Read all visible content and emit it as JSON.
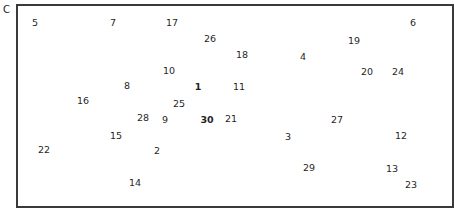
{
  "corner_label": "C",
  "frame": {
    "border_color": "#3a3a3a"
  },
  "numbers": [
    {
      "label": "5",
      "x": 35,
      "y": 23,
      "bold": false
    },
    {
      "label": "7",
      "x": 113,
      "y": 23,
      "bold": false
    },
    {
      "label": "17",
      "x": 172,
      "y": 23,
      "bold": false
    },
    {
      "label": "6",
      "x": 413,
      "y": 23,
      "bold": false
    },
    {
      "label": "26",
      "x": 210,
      "y": 39,
      "bold": false
    },
    {
      "label": "19",
      "x": 354,
      "y": 41,
      "bold": false
    },
    {
      "label": "18",
      "x": 242,
      "y": 55,
      "bold": false
    },
    {
      "label": "4",
      "x": 303,
      "y": 57,
      "bold": false
    },
    {
      "label": "10",
      "x": 169,
      "y": 71,
      "bold": false
    },
    {
      "label": "20",
      "x": 367,
      "y": 72,
      "bold": false
    },
    {
      "label": "24",
      "x": 398,
      "y": 72,
      "bold": false
    },
    {
      "label": "8",
      "x": 127,
      "y": 86,
      "bold": false
    },
    {
      "label": "1",
      "x": 198,
      "y": 87,
      "bold": true
    },
    {
      "label": "11",
      "x": 239,
      "y": 87,
      "bold": false
    },
    {
      "label": "16",
      "x": 83,
      "y": 101,
      "bold": false
    },
    {
      "label": "25",
      "x": 179,
      "y": 104,
      "bold": false
    },
    {
      "label": "28",
      "x": 143,
      "y": 118,
      "bold": false
    },
    {
      "label": "9",
      "x": 165,
      "y": 120,
      "bold": false
    },
    {
      "label": "30",
      "x": 207,
      "y": 120,
      "bold": true
    },
    {
      "label": "21",
      "x": 231,
      "y": 119,
      "bold": false
    },
    {
      "label": "27",
      "x": 337,
      "y": 120,
      "bold": false
    },
    {
      "label": "15",
      "x": 116,
      "y": 136,
      "bold": false
    },
    {
      "label": "3",
      "x": 288,
      "y": 137,
      "bold": false
    },
    {
      "label": "12",
      "x": 401,
      "y": 136,
      "bold": false
    },
    {
      "label": "22",
      "x": 44,
      "y": 150,
      "bold": false
    },
    {
      "label": "2",
      "x": 157,
      "y": 151,
      "bold": false
    },
    {
      "label": "29",
      "x": 309,
      "y": 168,
      "bold": false
    },
    {
      "label": "13",
      "x": 392,
      "y": 169,
      "bold": false
    },
    {
      "label": "14",
      "x": 135,
      "y": 183,
      "bold": false
    },
    {
      "label": "23",
      "x": 411,
      "y": 185,
      "bold": false
    }
  ]
}
